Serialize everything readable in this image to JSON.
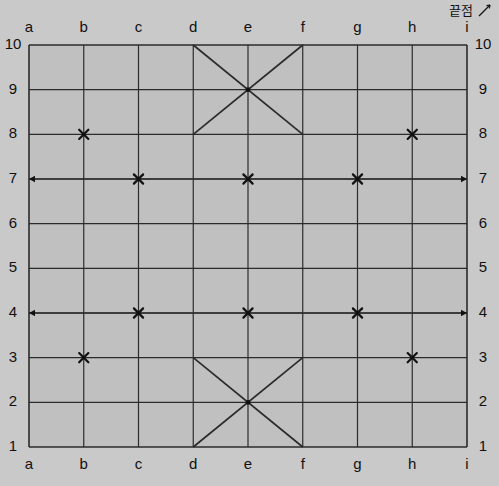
{
  "annotation": {
    "endpoint_label": "끝점",
    "endpoint_icon_name": "diagonal-line-icon"
  },
  "colors": {
    "page_background": "#c9c9c9",
    "board_background": "#c0c0c0",
    "grid_line": "#2b2b2b",
    "marker": "#111111",
    "label_text": "#111111",
    "accent": "#2b2b2b"
  },
  "board": {
    "column_labels": [
      "a",
      "b",
      "c",
      "d",
      "e",
      "f",
      "g",
      "h",
      "i"
    ],
    "row_labels": [
      "10",
      "9",
      "8",
      "7",
      "6",
      "5",
      "4",
      "3",
      "2",
      "1"
    ],
    "columns": 9,
    "rows": 10,
    "geometry": {
      "left": 29,
      "top": 45,
      "right": 467,
      "bottom": 447
    },
    "labels_top": true,
    "labels_bottom": true,
    "labels_left": true,
    "labels_right": true
  },
  "chart_data": {
    "type": "table",
    "title": "",
    "x": [
      "a",
      "b",
      "c",
      "d",
      "e",
      "f",
      "g",
      "h",
      "i"
    ],
    "y": [
      10,
      9,
      8,
      7,
      6,
      5,
      4,
      3,
      2,
      1
    ],
    "grid": true,
    "xlabel": "",
    "ylabel": "",
    "markers": [
      {
        "col": "b",
        "row": 8,
        "shape": "x"
      },
      {
        "col": "h",
        "row": 8,
        "shape": "x"
      },
      {
        "col": "c",
        "row": 7,
        "shape": "x"
      },
      {
        "col": "e",
        "row": 7,
        "shape": "x"
      },
      {
        "col": "g",
        "row": 7,
        "shape": "x"
      },
      {
        "col": "c",
        "row": 4,
        "shape": "x"
      },
      {
        "col": "e",
        "row": 4,
        "shape": "x"
      },
      {
        "col": "g",
        "row": 4,
        "shape": "x"
      },
      {
        "col": "b",
        "row": 3,
        "shape": "x"
      },
      {
        "col": "h",
        "row": 3,
        "shape": "x"
      }
    ],
    "arrow_lines": [
      {
        "from": {
          "col": "a",
          "row": 7
        },
        "to": {
          "col": "i",
          "row": 7
        },
        "arrows": "both"
      },
      {
        "from": {
          "col": "a",
          "row": 4
        },
        "to": {
          "col": "i",
          "row": 4
        },
        "arrows": "both"
      }
    ],
    "diagonals": [
      {
        "from": {
          "col": "d",
          "row": 10
        },
        "to": {
          "col": "f",
          "row": 8
        }
      },
      {
        "from": {
          "col": "f",
          "row": 10
        },
        "to": {
          "col": "d",
          "row": 8
        }
      },
      {
        "from": {
          "col": "d",
          "row": 3
        },
        "to": {
          "col": "f",
          "row": 1
        }
      },
      {
        "from": {
          "col": "f",
          "row": 3
        },
        "to": {
          "col": "d",
          "row": 1
        }
      }
    ],
    "crossing_points": [
      {
        "col": "e",
        "row": 9
      },
      {
        "col": "e",
        "row": 2
      }
    ]
  }
}
